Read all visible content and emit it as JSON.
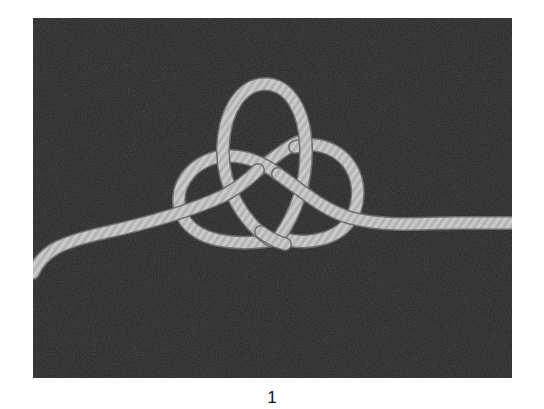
{
  "figure": {
    "caption": "1"
  },
  "colors": {
    "page_background": "#ffffff",
    "photo_background": "#262626",
    "rope": "#c9c9c9",
    "rope_shadow": "#8a8a8a",
    "caption_text": "#111111"
  }
}
